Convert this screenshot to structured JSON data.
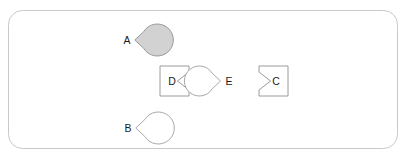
{
  "canvas": {
    "name": "shape-canvas",
    "width": 405,
    "height": 158,
    "background_color": "#ffffff",
    "border_color": "#c9c9c9",
    "border_radius": 14,
    "frame": {
      "x": 8,
      "y": 10,
      "width": 389,
      "height": 138
    }
  },
  "shapes": [
    {
      "id": "A",
      "label": "A",
      "kind": "circle",
      "notch_side": "right",
      "fill": "#d2d2d2",
      "stroke": "#9a9a9a",
      "cx": 130,
      "cy": 40,
      "r": 16,
      "label_x": 127,
      "label_y": 40
    },
    {
      "id": "B",
      "label": "B",
      "kind": "circle",
      "notch_side": "right",
      "fill": "#ffffff",
      "stroke": "#a8a8a8",
      "cx": 131,
      "cy": 128,
      "r": 16,
      "label_x": 128,
      "label_y": 128
    },
    {
      "id": "D",
      "label": "D",
      "kind": "square",
      "notch_side": "right",
      "fill": "#ffffff",
      "stroke": "#9a9a9a",
      "x": 160,
      "y": 66,
      "width": 29,
      "height": 30,
      "label_x": 172,
      "label_y": 81
    },
    {
      "id": "E",
      "label": "E",
      "kind": "circle",
      "notch_side": "left",
      "fill": "#ffffff",
      "stroke": "#a8a8a8",
      "cx": 225,
      "cy": 81,
      "r": 15,
      "label_x": 229,
      "label_y": 81
    },
    {
      "id": "C",
      "label": "C",
      "kind": "square",
      "notch_side": "left",
      "fill": "#ffffff",
      "stroke": "#9a9a9a",
      "x": 259,
      "y": 66,
      "width": 29,
      "height": 30,
      "label_x": 276,
      "label_y": 81
    }
  ]
}
